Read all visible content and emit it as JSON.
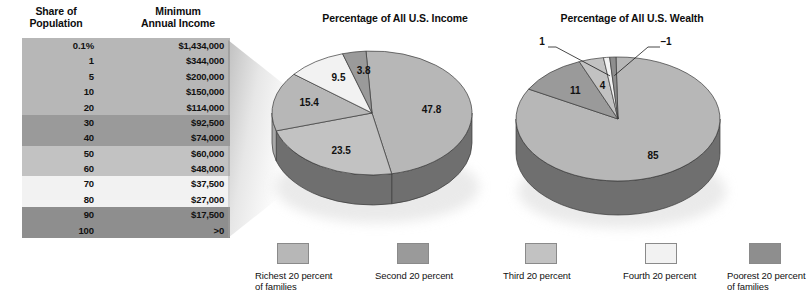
{
  "table": {
    "headers": {
      "share": "Share of\nPopulation",
      "share_line1": "Share of",
      "share_line2": "Population",
      "income_line1": "Minimum",
      "income_line2": "Annual Income"
    },
    "rows": [
      {
        "share": "0.1%",
        "income": "$1,434,000",
        "group": 0
      },
      {
        "share": "1",
        "income": "$344,000",
        "group": 0
      },
      {
        "share": "5",
        "income": "$200,000",
        "group": 0
      },
      {
        "share": "10",
        "income": "$150,000",
        "group": 0
      },
      {
        "share": "20",
        "income": "$114,000",
        "group": 0
      },
      {
        "share": "30",
        "income": "$92,500",
        "group": 1
      },
      {
        "share": "40",
        "income": "$74,000",
        "group": 1
      },
      {
        "share": "50",
        "income": "$60,000",
        "group": 2
      },
      {
        "share": "60",
        "income": "$48,000",
        "group": 2
      },
      {
        "share": "70",
        "income": "$37,500",
        "group": 3
      },
      {
        "share": "80",
        "income": "$27,000",
        "group": 3
      },
      {
        "share": "90",
        "income": "$17,500",
        "group": 4
      },
      {
        "share": "100",
        "income": ">0",
        "group": 4
      }
    ],
    "group_colors": [
      "#b7b7b7",
      "#9a9a9a",
      "#c2c2c2",
      "#f2f2f2",
      "#8e8e8e"
    ]
  },
  "colors": {
    "richest": "#b7b7b7",
    "second": "#9a9a9a",
    "third": "#c2c2c2",
    "fourth": "#f2f2f2",
    "poorest": "#8e8e8e",
    "rim_dark": "#6f6f6f",
    "rim_light": "#a5a5a5"
  },
  "chart_data": [
    {
      "type": "pie",
      "title": "Percentage of All U.S. Income",
      "categories": [
        "Richest 20 percent of families",
        "Second 20 percent",
        "Third 20 percent",
        "Fourth 20 percent",
        "Poorest 20 percent of families"
      ],
      "values": [
        47.8,
        23.5,
        15.4,
        9.5,
        3.8
      ],
      "labels": [
        "47.8",
        "23.5",
        "15.4",
        "9.5",
        "3.8"
      ],
      "colors": [
        "#b7b7b7",
        "#c2c2c2",
        "#b7b7b7",
        "#f2f2f2",
        "#9a9a9a"
      ],
      "legend_position": "bottom",
      "three_d": true
    },
    {
      "type": "pie",
      "title": "Percentage of All U.S. Wealth",
      "categories": [
        "Richest 20 percent of families",
        "Second 20 percent",
        "Third 20 percent",
        "Fourth 20 percent",
        "Poorest 20 percent of families"
      ],
      "values": [
        85,
        11,
        4,
        1,
        -1
      ],
      "labels": [
        "85",
        "11",
        "4",
        "1",
        "–1"
      ],
      "colors": [
        "#b7b7b7",
        "#9a9a9a",
        "#c2c2c2",
        "#f2f2f2",
        "#8e8e8e"
      ],
      "legend_position": "bottom",
      "three_d": true
    }
  ],
  "legend": {
    "items": [
      {
        "line1": "Richest 20 percent",
        "line2": "of families",
        "color": "#b7b7b7"
      },
      {
        "line1": "Second 20 percent",
        "line2": "",
        "color": "#9a9a9a"
      },
      {
        "line1": "Third 20 percent",
        "line2": "",
        "color": "#c2c2c2"
      },
      {
        "line1": "Fourth 20 percent",
        "line2": "",
        "color": "#f2f2f2"
      },
      {
        "line1": "Poorest 20 percent",
        "line2": "of families",
        "color": "#8e8e8e"
      }
    ]
  }
}
